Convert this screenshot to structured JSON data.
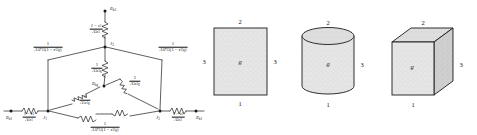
{
  "figure": {
    "stroke_color": "#1a1a1a",
    "fill_color": "#e3e3e3"
  },
  "network": {
    "nodes": [
      {
        "id": "eb3",
        "label": "E",
        "sub": "b3",
        "x": 105,
        "y": 10
      },
      {
        "id": "j3",
        "label": "J",
        "sub": "3",
        "x": 105,
        "y": 47
      },
      {
        "id": "ebg",
        "label": "E",
        "sub": "bg",
        "x": 102,
        "y": 86
      },
      {
        "id": "j1",
        "label": "J",
        "sub": "1",
        "x": 48,
        "y": 111
      },
      {
        "id": "j2",
        "label": "J",
        "sub": "2",
        "x": 160,
        "y": 111
      },
      {
        "id": "eb1",
        "label": "E",
        "sub": "b1",
        "x": 11,
        "y": 111
      },
      {
        "id": "eb2",
        "label": "E",
        "sub": "b2",
        "x": 196,
        "y": 111
      }
    ],
    "resistors": [
      {
        "id": "surface-3",
        "numerator": "1 − ε<sub>3</sub>",
        "denominator": "A<sub>3</sub>ε<sub>3</sub>",
        "x": 96,
        "y": 29
      },
      {
        "id": "gas-3",
        "numerator": "1",
        "denominator": "A<sub>3</sub>ε<sub>3g</sub>",
        "x": 98,
        "y": 68
      },
      {
        "id": "gas-2",
        "numerator": "1",
        "denominator": "A<sub>2</sub>ε<sub>2g</sub>",
        "x": 134,
        "y": 82
      },
      {
        "id": "gas-1",
        "numerator": "1",
        "denominator": "A<sub>1</sub>ε<sub>1g</sub>",
        "x": 84,
        "y": 101
      },
      {
        "id": "view-13",
        "numerator": "1",
        "denominator": "A<sub>1</sub>F<sub>13</sub>(1 − τ<sub>13g</sub>)",
        "x": 48,
        "y": 48
      },
      {
        "id": "view-23",
        "numerator": "1",
        "denominator": "A<sub>2</sub>F<sub>23</sub>(1 − τ<sub>23g</sub>)",
        "x": 172,
        "y": 48
      },
      {
        "id": "view-12",
        "numerator": "1",
        "denominator": "A<sub>1</sub>F<sub>12</sub>(1 − τ<sub>12g</sub>)",
        "x": 105,
        "y": 124
      },
      {
        "id": "surface-1",
        "numerator": "1 − ε<sub>1</sub>",
        "denominator": "A<sub>1</sub>ε<sub>1</sub>",
        "x": 30,
        "y": 117
      },
      {
        "id": "surface-2",
        "numerator": "1 − ε<sub>2</sub>",
        "denominator": "A<sub>2</sub>ε<sub>2</sub>",
        "x": 178,
        "y": 117
      }
    ]
  },
  "shapes": [
    {
      "id": "rectangle",
      "type": "rectangle",
      "inner_label": "g",
      "labels": {
        "top": "2",
        "right": "3",
        "bottom": "1",
        "left": "3"
      }
    },
    {
      "id": "cylinder",
      "type": "cylinder",
      "inner_label": "g",
      "labels": {
        "top": "2",
        "right": "3",
        "bottom": "1"
      }
    },
    {
      "id": "cube",
      "type": "cube",
      "inner_label": "g",
      "labels": {
        "top": "2",
        "right": "3",
        "bottom": "1"
      }
    }
  ]
}
